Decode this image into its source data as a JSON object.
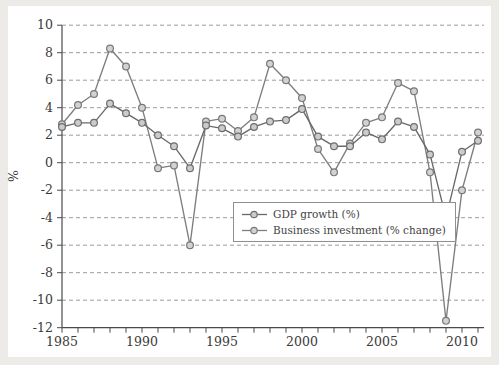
{
  "figure": {
    "page_background": "#edebe8",
    "plot_background": "#ffffff",
    "axis_color": "#4a4a4a",
    "grid_color": "#9c9c9c",
    "tick_label_color": "#3a3a3a"
  },
  "legend": {
    "items": [
      {
        "label": "GDP growth (%)"
      },
      {
        "label": "Business investment (% change)"
      }
    ]
  },
  "chart_data": {
    "type": "line",
    "title": "",
    "xlabel": "",
    "ylabel": "%",
    "ylim": [
      -12,
      10
    ],
    "xlim": [
      1985,
      2011
    ],
    "grid": "horizontal-dashed",
    "legend_position": "center",
    "y_ticks": [
      10,
      8,
      6,
      4,
      2,
      0,
      -2,
      -4,
      -6,
      -8,
      -10,
      -12
    ],
    "x_ticks": [
      1985,
      1990,
      1995,
      2000,
      2005,
      2010
    ],
    "x": [
      1985,
      1986,
      1987,
      1988,
      1989,
      1990,
      1991,
      1992,
      1993,
      1994,
      1995,
      1996,
      1997,
      1998,
      1999,
      2000,
      2001,
      2002,
      2003,
      2004,
      2005,
      2006,
      2007,
      2008,
      2009,
      2010,
      2011
    ],
    "series": [
      {
        "name": "GDP growth (%)",
        "color": "#686868",
        "marker_fill": "#cbcbcb",
        "marker_edge": "#6e6e6e",
        "values": [
          2.6,
          2.9,
          2.9,
          4.3,
          3.6,
          2.9,
          2.0,
          1.2,
          -0.4,
          2.7,
          2.5,
          1.9,
          2.6,
          3.0,
          3.1,
          3.9,
          1.9,
          1.2,
          1.2,
          2.2,
          1.7,
          3.0,
          2.6,
          0.6,
          -4.0,
          0.8,
          1.6
        ]
      },
      {
        "name": "Business investment (% change)",
        "color": "#7e7e7e",
        "marker_fill": "#d2d2d2",
        "marker_edge": "#787878",
        "values": [
          2.8,
          4.2,
          5.0,
          8.3,
          7.0,
          4.0,
          -0.4,
          -0.2,
          -6.0,
          3.0,
          3.2,
          2.3,
          3.3,
          7.2,
          6.0,
          4.7,
          1.0,
          -0.7,
          1.4,
          2.9,
          3.3,
          5.8,
          5.2,
          -0.7,
          -11.5,
          -2.0,
          2.2
        ]
      }
    ]
  }
}
